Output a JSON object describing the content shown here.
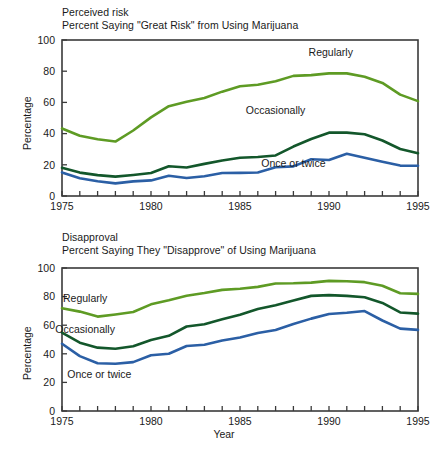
{
  "figure": {
    "xlabel": "Year",
    "ylabel": "Percentage"
  },
  "chart_data": [
    {
      "type": "line",
      "title": "Perceived risk",
      "subtitle": "Percent Saying \"Great Risk\" from Using Marijuana",
      "xlabel": "",
      "ylabel": "Percentage",
      "xlim": [
        1975,
        1995
      ],
      "ylim": [
        0,
        100
      ],
      "xticks": [
        1975,
        1976,
        1977,
        1978,
        1979,
        1980,
        1981,
        1982,
        1983,
        1984,
        1985,
        1986,
        1987,
        1988,
        1989,
        1990,
        1991,
        1992,
        1993,
        1994,
        1995
      ],
      "xticklabels": [
        "1975",
        "",
        "",
        "",
        "",
        "1980",
        "",
        "",
        "",
        "",
        "1985",
        "",
        "",
        "",
        "",
        "1990",
        "",
        "",
        "",
        "",
        "1995"
      ],
      "yticks": [
        0,
        20,
        40,
        60,
        80,
        100
      ],
      "yticklabels": [
        "0",
        "20",
        "40",
        "60",
        "80",
        "100"
      ],
      "grid": false,
      "legend_position": "inline-annotations",
      "x": [
        1975,
        1976,
        1977,
        1978,
        1979,
        1980,
        1981,
        1982,
        1983,
        1984,
        1985,
        1986,
        1987,
        1988,
        1989,
        1990,
        1991,
        1992,
        1993,
        1994,
        1995
      ],
      "series": [
        {
          "name": "Regularly",
          "color": "#5E9B24",
          "label_x": 1990.1,
          "label_y": 92,
          "values": [
            43.3,
            38.6,
            36.4,
            34.9,
            42.0,
            50.4,
            57.6,
            60.4,
            62.8,
            66.9,
            70.4,
            71.3,
            73.5,
            77.0,
            77.5,
            78.6,
            78.6,
            76.5,
            72.5,
            65.0,
            60.8
          ]
        },
        {
          "name": "Occasionally",
          "color": "#13572B",
          "label_x": 1987.0,
          "label_y": 55,
          "values": [
            18.1,
            15.0,
            13.4,
            12.4,
            13.5,
            14.7,
            19.1,
            18.3,
            20.6,
            22.8,
            24.5,
            25.0,
            26.0,
            31.7,
            36.5,
            40.6,
            40.6,
            39.6,
            35.6,
            30.1,
            27.4
          ]
        },
        {
          "name": "Once or twice",
          "color": "#2B5FA5",
          "label_x": 1988.0,
          "label_y": 21,
          "values": [
            15.1,
            11.4,
            9.5,
            8.1,
            9.4,
            10.0,
            13.0,
            11.5,
            12.7,
            14.7,
            14.8,
            15.1,
            18.4,
            19.0,
            23.6,
            23.1,
            27.1,
            24.5,
            21.9,
            19.5,
            19.4
          ]
        }
      ]
    },
    {
      "type": "line",
      "title": "Disapproval",
      "subtitle": "Percent Saying They \"Disapprove\" of Using Marijuana",
      "xlabel": "Year",
      "ylabel": "Percentage",
      "xlim": [
        1975,
        1995
      ],
      "ylim": [
        0,
        100
      ],
      "xticks": [
        1975,
        1976,
        1977,
        1978,
        1979,
        1980,
        1981,
        1982,
        1983,
        1984,
        1985,
        1986,
        1987,
        1988,
        1989,
        1990,
        1991,
        1992,
        1993,
        1994,
        1995
      ],
      "xticklabels": [
        "1975",
        "",
        "",
        "",
        "",
        "1980",
        "",
        "",
        "",
        "",
        "1985",
        "",
        "",
        "",
        "",
        "1990",
        "",
        "",
        "",
        "",
        "1995"
      ],
      "yticks": [
        0,
        20,
        40,
        60,
        80,
        100
      ],
      "yticklabels": [
        "0",
        "20",
        "40",
        "60",
        "80",
        "100"
      ],
      "grid": false,
      "legend_position": "inline-annotations",
      "x": [
        1975,
        1976,
        1977,
        1978,
        1979,
        1980,
        1981,
        1982,
        1983,
        1984,
        1985,
        1986,
        1987,
        1988,
        1989,
        1990,
        1991,
        1992,
        1993,
        1994,
        1995
      ],
      "series": [
        {
          "name": "Regularly",
          "color": "#5E9B24",
          "label_x": 1976.3,
          "label_y": 79,
          "values": [
            71.9,
            69.5,
            66.0,
            67.5,
            69.2,
            74.6,
            77.4,
            80.6,
            82.5,
            84.7,
            85.5,
            86.8,
            89.2,
            89.3,
            89.8,
            91.0,
            90.7,
            90.1,
            87.6,
            82.3,
            81.9
          ]
        },
        {
          "name": "Occasionally",
          "color": "#13572B",
          "label_x": 1976.3,
          "label_y": 57,
          "values": [
            54.8,
            47.8,
            44.3,
            43.5,
            45.3,
            49.7,
            52.6,
            59.1,
            60.7,
            64.1,
            67.3,
            71.3,
            74.0,
            77.2,
            80.5,
            81.0,
            80.5,
            79.5,
            75.6,
            68.9,
            68.1
          ]
        },
        {
          "name": "Once or twice",
          "color": "#2B5FA5",
          "label_x": 1977.1,
          "label_y": 26,
          "values": [
            47.0,
            38.4,
            33.4,
            33.0,
            34.2,
            39.0,
            40.0,
            45.5,
            46.3,
            49.3,
            51.4,
            54.6,
            56.6,
            60.8,
            64.6,
            67.8,
            68.7,
            69.9,
            63.3,
            57.6,
            56.7
          ]
        }
      ]
    }
  ]
}
